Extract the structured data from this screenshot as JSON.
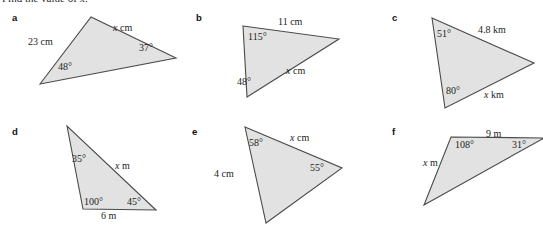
{
  "page": {
    "heading": "Find the value of x.",
    "background": "#ffffff",
    "figure_fill": "#e2e2e2",
    "figure_stroke": "#4a4a4a",
    "text_color": "#1c1c1c"
  },
  "items": [
    {
      "key": "a",
      "label": "a",
      "label_pos": {
        "x": 12,
        "y": 13
      },
      "triangle": {
        "points": "40,84 91,17 176,58"
      },
      "annotations": [
        {
          "name": "side-23cm",
          "text": "23 cm",
          "x": 28,
          "y": 37,
          "italic": false
        },
        {
          "name": "side-x-cm",
          "text": "x cm",
          "x": 113,
          "y": 23,
          "italic": true
        },
        {
          "name": "angle-48",
          "text": "48°",
          "x": 58,
          "y": 62,
          "italic": false
        },
        {
          "name": "angle-37",
          "text": "37°",
          "x": 139,
          "y": 43,
          "italic": false
        }
      ]
    },
    {
      "key": "b",
      "label": "b",
      "label_pos": {
        "x": 196,
        "y": 13
      },
      "triangle": {
        "points": "243,26 339,39 247,97"
      },
      "annotations": [
        {
          "name": "side-11cm",
          "text": "11 cm",
          "x": 278,
          "y": 17,
          "italic": false
        },
        {
          "name": "angle-115",
          "text": "115°",
          "x": 248,
          "y": 32,
          "italic": false
        },
        {
          "name": "side-x-cm",
          "text": "x cm",
          "x": 286,
          "y": 66,
          "italic": true
        },
        {
          "name": "angle-48",
          "text": "48°",
          "x": 237,
          "y": 77,
          "italic": false
        }
      ]
    },
    {
      "key": "c",
      "label": "c",
      "label_pos": {
        "x": 392,
        "y": 13
      },
      "triangle": {
        "points": "432,18 534,63 445,108"
      },
      "annotations": [
        {
          "name": "angle-51",
          "text": "51°",
          "x": 437,
          "y": 29,
          "italic": false
        },
        {
          "name": "side-4.8km",
          "text": "4.8 km",
          "x": 478,
          "y": 25,
          "italic": false
        },
        {
          "name": "angle-80",
          "text": "80°",
          "x": 446,
          "y": 86,
          "italic": false
        },
        {
          "name": "side-x-km",
          "text": "x km",
          "x": 484,
          "y": 90,
          "italic": true
        }
      ]
    },
    {
      "key": "d",
      "label": "d",
      "label_pos": {
        "x": 12,
        "y": 127
      },
      "triangle": {
        "points": "67,126 83,209 156,210"
      },
      "annotations": [
        {
          "name": "angle-35",
          "text": "35°",
          "x": 72,
          "y": 154,
          "italic": false
        },
        {
          "name": "side-x-m",
          "text": "x m",
          "x": 115,
          "y": 161,
          "italic": true
        },
        {
          "name": "angle-100",
          "text": "100°",
          "x": 84,
          "y": 197,
          "italic": false
        },
        {
          "name": "angle-45",
          "text": "45°",
          "x": 127,
          "y": 197,
          "italic": false
        },
        {
          "name": "side-6m",
          "text": "6 m",
          "x": 101,
          "y": 211,
          "italic": false
        }
      ]
    },
    {
      "key": "e",
      "label": "e",
      "label_pos": {
        "x": 192,
        "y": 127
      },
      "triangle": {
        "points": "245,127 342,168 266,223"
      },
      "annotations": [
        {
          "name": "angle-58",
          "text": "58°",
          "x": 249,
          "y": 138,
          "italic": false
        },
        {
          "name": "side-x-cm",
          "text": "x cm",
          "x": 290,
          "y": 133,
          "italic": true
        },
        {
          "name": "angle-55",
          "text": "55°",
          "x": 310,
          "y": 163,
          "italic": false
        },
        {
          "name": "side-4cm",
          "text": "4 cm",
          "x": 214,
          "y": 169,
          "italic": false
        }
      ]
    },
    {
      "key": "f",
      "label": "f",
      "label_pos": {
        "x": 392,
        "y": 127
      },
      "triangle": {
        "points": "451,137 544,138 424,205"
      },
      "annotations": [
        {
          "name": "side-9m",
          "text": "9 m",
          "x": 486,
          "y": 129,
          "italic": false
        },
        {
          "name": "angle-108",
          "text": "108°",
          "x": 455,
          "y": 140,
          "italic": false
        },
        {
          "name": "angle-31",
          "text": "31°",
          "x": 512,
          "y": 140,
          "italic": false
        },
        {
          "name": "side-x-m",
          "text": "x m",
          "x": 423,
          "y": 158,
          "italic": true
        }
      ]
    }
  ]
}
